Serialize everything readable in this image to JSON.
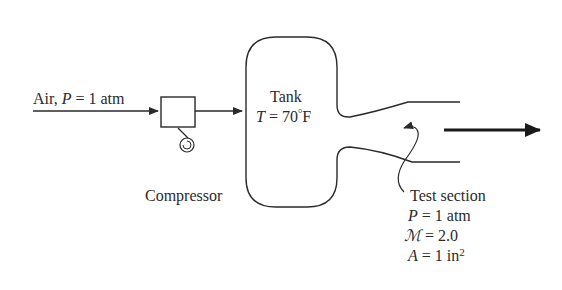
{
  "diagram": {
    "inlet": {
      "label_prefix": "Air, ",
      "label_var": "P",
      "label_suffix": " = 1 atm"
    },
    "compressor": {
      "label": "Compressor"
    },
    "tank": {
      "title": "Tank",
      "temp_var": "T",
      "temp_value": " = 70",
      "temp_degree": "°",
      "temp_unit": "F"
    },
    "test_section": {
      "title": "Test section",
      "pressure_var": "P",
      "pressure_value": " = 1 atm",
      "mach_var": "ℳ",
      "mach_value": " = 2.0",
      "area_var": "A",
      "area_value": " = 1 in",
      "area_exponent": "2"
    },
    "colors": {
      "line": "#2a2a2a",
      "background": "#ffffff"
    }
  }
}
